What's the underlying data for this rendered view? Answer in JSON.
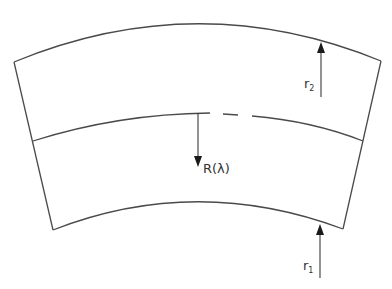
{
  "diagram": {
    "type": "annular-sector-cross-section",
    "colors": {
      "stroke": "#4a4a4a",
      "arrow": "#1a1a1a",
      "text": "#333333",
      "background": "#ffffff"
    },
    "labels": {
      "outer_radius": {
        "base": "r",
        "sub": "2"
      },
      "inner_radius": {
        "base": "r",
        "sub": "1"
      },
      "center_radius": "R(λ)"
    },
    "shape": {
      "outer_arc": {
        "from": [
          14,
          62
        ],
        "peak": [
          200,
          24
        ],
        "to": [
          381,
          61
        ]
      },
      "middle_arc": {
        "from": [
          33,
          141
        ],
        "peak": [
          200,
          113
        ],
        "to": [
          363,
          141
        ],
        "dashed_segment": [
          210,
          252
        ]
      },
      "inner_arc": {
        "from": [
          53,
          230
        ],
        "peak": [
          200,
          202
        ],
        "to": [
          343,
          229
        ]
      }
    },
    "arrows": [
      {
        "name": "r2-arrow",
        "x": 321,
        "y_from": 97,
        "y_to": 43,
        "direction": "up"
      },
      {
        "name": "R-lambda-arrow",
        "x": 198,
        "y_from": 113,
        "y_to": 166,
        "direction": "down"
      },
      {
        "name": "r1-arrow",
        "x": 320,
        "y_from": 278,
        "y_to": 225,
        "direction": "up"
      }
    ]
  }
}
